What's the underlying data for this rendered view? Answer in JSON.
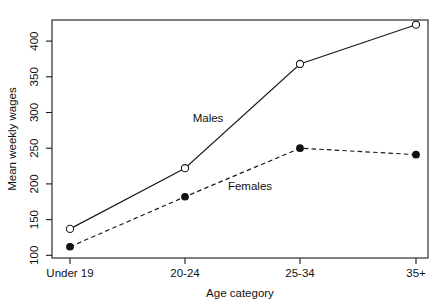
{
  "chart_data": {
    "type": "line",
    "title": "",
    "xlabel": "Age category",
    "ylabel": "Mean weekly wages",
    "categories": [
      "Under 19",
      "20-24",
      "25-34",
      "35+"
    ],
    "series": [
      {
        "name": "Males",
        "values": [
          137,
          222,
          368,
          423
        ],
        "marker": "open-circle",
        "linestyle": "solid",
        "color": "#1a1a1a",
        "annotation": "Males"
      },
      {
        "name": "Females",
        "values": [
          112,
          182,
          250,
          241
        ],
        "marker": "filled-circle",
        "linestyle": "dashed",
        "color": "#111111",
        "annotation": "Females"
      }
    ],
    "yticks": [
      100,
      150,
      200,
      250,
      300,
      350,
      400
    ],
    "ytick_labels": [
      "100",
      "150",
      "200",
      "250",
      "300",
      "350",
      "400"
    ],
    "ylim": [
      100,
      433
    ],
    "xtick_labels": [
      "Under 19",
      "20-24",
      "25-34",
      "35+"
    ],
    "grid": false,
    "legend": "inline-annotations",
    "frame": true
  },
  "annotations": {
    "males_label": "Males",
    "females_label": "Females"
  },
  "axes": {
    "x_title": "Age category",
    "y_title": "Mean weekly wages"
  }
}
